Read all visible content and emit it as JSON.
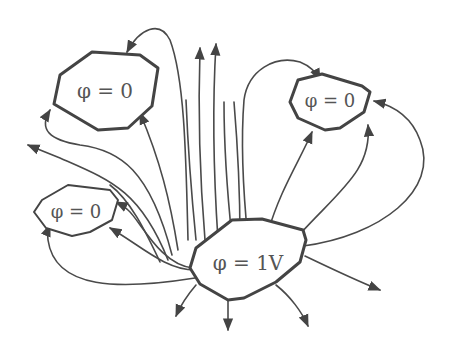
{
  "diagram": {
    "type": "electric field lines between conductors",
    "conductors": [
      {
        "id": "top-left",
        "label": "φ = 0"
      },
      {
        "id": "top-right",
        "label": "φ = 0"
      },
      {
        "id": "left",
        "label": "φ = 0"
      },
      {
        "id": "center",
        "label": "φ = 1V"
      }
    ],
    "colors": {
      "line": "#4a4a4a",
      "outline": "#444444",
      "text": "#555555",
      "background": "#ffffff"
    }
  }
}
